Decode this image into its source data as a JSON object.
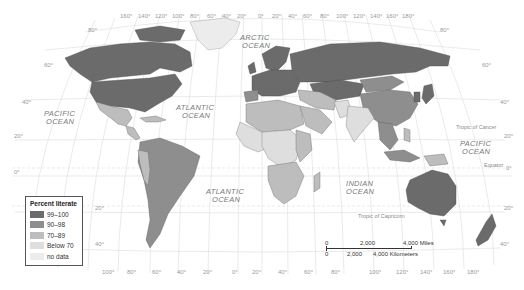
{
  "map": {
    "title": "Percent literate",
    "oceans": [
      {
        "id": "arctic",
        "line1": "ARCTIC",
        "line2": "OCEAN"
      },
      {
        "id": "pacific-west",
        "line1": "PACIFIC",
        "line2": "OCEAN"
      },
      {
        "id": "atlantic-north",
        "line1": "ATLANTIC",
        "line2": "OCEAN"
      },
      {
        "id": "atlantic-south",
        "line1": "ATLANTIC",
        "line2": "OCEAN"
      },
      {
        "id": "indian",
        "line1": "INDIAN",
        "line2": "OCEAN"
      },
      {
        "id": "pacific-east",
        "line1": "PACIFIC",
        "line2": "OCEAN"
      }
    ],
    "reference_lines": {
      "tropic_cancer": "Tropic of Cancer",
      "equator": "Equator",
      "tropic_capricorn": "Tropic of Capricorn"
    },
    "top_longitudes": [
      "160°",
      "140°",
      "120°",
      "100°",
      "80°",
      "60°",
      "40°",
      "20°",
      "0°",
      "20°",
      "40°",
      "60°",
      "80°",
      "100°",
      "120°",
      "140°",
      "160°",
      "180°"
    ],
    "bottom_longitudes": [
      "100°",
      "80°",
      "60°",
      "40°",
      "20°",
      "0°",
      "20°",
      "40°",
      "60°",
      "80°",
      "100°",
      "120°",
      "140°",
      "160°",
      "180°"
    ],
    "left_latitudes": [
      "80°",
      "60°",
      "40°",
      "20°",
      "0°",
      "20°",
      "40°"
    ],
    "right_latitudes": [
      "80°",
      "60°",
      "40°",
      "20°",
      "0°",
      "20°",
      "40°"
    ]
  },
  "legend": {
    "title": "Percent literate",
    "items": [
      {
        "label": "99–100",
        "color": "#6b6b6b"
      },
      {
        "label": "90–98",
        "color": "#8e8e8e"
      },
      {
        "label": "70–89",
        "color": "#bdbdbd"
      },
      {
        "label": "Below 70",
        "color": "#dedede"
      },
      {
        "label": "no data",
        "color": "#ececec"
      }
    ]
  },
  "scale_bar": {
    "miles": {
      "start": "0",
      "mid": "2,000",
      "end": "4,000 Miles"
    },
    "km": {
      "start": "0",
      "mid": "2,000",
      "end": "4,000 Kilometers"
    }
  }
}
